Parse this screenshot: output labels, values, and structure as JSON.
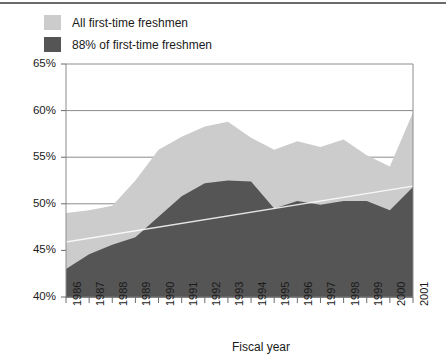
{
  "legend": {
    "items": [
      {
        "label": "All first-time freshmen",
        "color": "#cccccc",
        "swatch_name": "legend-swatch-all-freshmen"
      },
      {
        "label": "88% of first-time freshmen",
        "color": "#555555",
        "swatch_name": "legend-swatch-88-percent"
      }
    ]
  },
  "axis": {
    "x_title": "Fiscal year",
    "y_ticks": [
      "65%",
      "60%",
      "55%",
      "50%",
      "45%",
      "40%"
    ]
  },
  "chart_data": {
    "type": "area",
    "title": "",
    "subtitle": "",
    "xlabel": "Fiscal year",
    "ylabel": "",
    "ylim": [
      40,
      65
    ],
    "ytick_values": [
      40,
      45,
      50,
      55,
      60,
      65
    ],
    "ytick_labels": [
      "40%",
      "45%",
      "50%",
      "55%",
      "60%",
      "65%"
    ],
    "grid": true,
    "legend_position": "top-left",
    "stacked": false,
    "x": [
      1986,
      1987,
      1988,
      1989,
      1990,
      1991,
      1992,
      1993,
      1994,
      1995,
      1996,
      1997,
      1998,
      1999,
      2000,
      2001
    ],
    "categories": [
      "1986",
      "1987",
      "1988",
      "1989",
      "1990",
      "1991",
      "1992",
      "1993",
      "1994",
      "1995",
      "1996",
      "1997",
      "1998",
      "1999",
      "2000",
      "2001"
    ],
    "series": [
      {
        "name": "All first-time freshmen",
        "color": "#cccccc",
        "values": [
          49.0,
          49.3,
          49.8,
          52.5,
          55.8,
          57.2,
          58.3,
          58.8,
          57.1,
          55.8,
          56.7,
          56.1,
          56.9,
          55.2,
          54.0,
          59.8
        ]
      },
      {
        "name": "88% of first-time freshmen",
        "color": "#555555",
        "values": [
          43.0,
          44.6,
          45.6,
          46.4,
          48.6,
          50.8,
          52.2,
          52.5,
          52.4,
          49.5,
          50.3,
          49.9,
          50.3,
          50.3,
          49.3,
          51.8
        ]
      }
    ],
    "trendline": {
      "name": "trend",
      "color": "#ffffff",
      "start": {
        "x": 1986,
        "y": 45.9
      },
      "end": {
        "x": 2001,
        "y": 51.9
      }
    }
  }
}
